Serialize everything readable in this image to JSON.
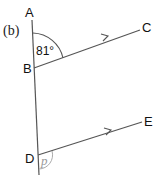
{
  "part_label": "(b)",
  "points": {
    "A": "A",
    "B": "B",
    "C": "C",
    "D": "D",
    "E": "E"
  },
  "angles": {
    "ABC": "81°",
    "at_D": "p"
  },
  "colors": {
    "line": "#555555",
    "text": "#111111",
    "unknown_angle": "#999999"
  }
}
